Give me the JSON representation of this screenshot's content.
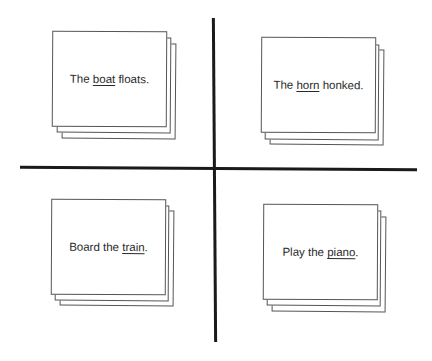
{
  "worksheet": {
    "dividers": {
      "color": "#1a1a1a"
    },
    "cards": [
      {
        "pre": "The ",
        "underlined": "boat",
        "post": " floats."
      },
      {
        "pre": "The ",
        "underlined": "horn",
        "post": " honked."
      },
      {
        "pre": "Board the ",
        "underlined": "train",
        "post": "."
      },
      {
        "pre": "Play the ",
        "underlined": "piano",
        "post": "."
      }
    ]
  }
}
